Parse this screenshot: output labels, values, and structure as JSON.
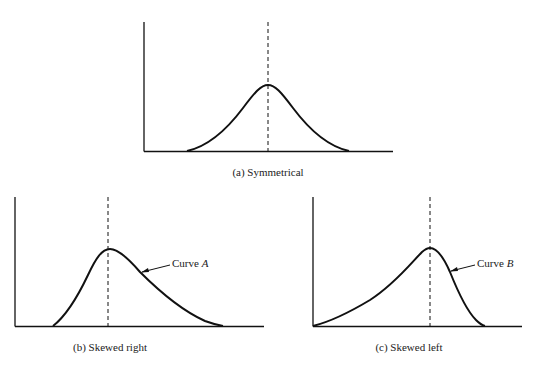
{
  "panels": [
    {
      "id": "a",
      "caption": "(a) Symmetrical",
      "curve_label": null,
      "shape": "symmetrical"
    },
    {
      "id": "b",
      "caption": "(b) Skewed right",
      "curve_label": {
        "prefix": "Curve ",
        "letter": "A"
      },
      "shape": "skewed-right"
    },
    {
      "id": "c",
      "caption": "(c) Skewed left",
      "curve_label": {
        "prefix": "Curve ",
        "letter": "B"
      },
      "shape": "skewed-left"
    }
  ],
  "colors": {
    "line": "#111111",
    "background": "#ffffff"
  }
}
